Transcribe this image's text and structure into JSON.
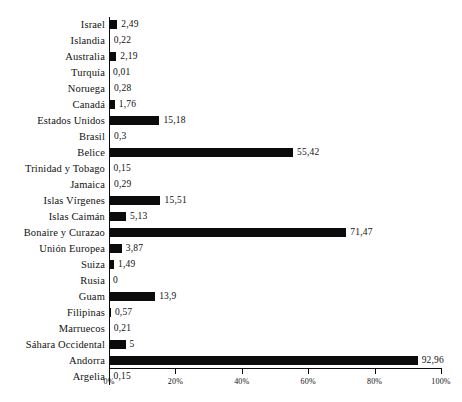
{
  "chart_data": {
    "type": "bar",
    "orientation": "horizontal",
    "title": "",
    "subtitle": "",
    "xlabel": "",
    "ylabel": "",
    "xlim": [
      0,
      100
    ],
    "grid": false,
    "legend": null,
    "bar_color": "#0b0b0b",
    "background_color": "#ffffff",
    "value_format": "comma-decimal",
    "categories": [
      "Israel",
      "Islandia",
      "Australia",
      "Turquía",
      "Noruega",
      "Canadá",
      "Estados Unidos",
      "Brasil",
      "Belice",
      "Trinidad y Tobago",
      "Jamaica",
      "Islas Vírgenes",
      "Islas Caimán",
      "Bonaire y Curazao",
      "Unión Europea",
      "Suiza",
      "Rusia",
      "Guam",
      "Filipinas",
      "Marruecos",
      "Sáhara Occidental",
      "Andorra",
      "Argelia"
    ],
    "values": [
      2.49,
      0.22,
      2.19,
      0.01,
      0.28,
      1.76,
      15.18,
      0.3,
      55.42,
      0.15,
      0.29,
      15.51,
      5.13,
      71.47,
      3.87,
      1.49,
      0,
      13.9,
      0.57,
      0.21,
      5,
      92.96,
      0.15
    ],
    "data_labels": [
      "2,49",
      "0,22",
      "2,19",
      "0,01",
      "0,28",
      "1,76",
      "15,18",
      "0,3",
      "55,42",
      "0,15",
      "0,29",
      "15,51",
      "5,13",
      "71,47",
      "3,87",
      "1,49",
      "0",
      "13,9",
      "0,57",
      "0,21",
      "5",
      "92,96",
      "0,15"
    ],
    "xticks": [
      0,
      20,
      40,
      60,
      80,
      100
    ],
    "xtick_labels": [
      "0%",
      "20%",
      "40%",
      "60%",
      "80%",
      "100%"
    ]
  }
}
